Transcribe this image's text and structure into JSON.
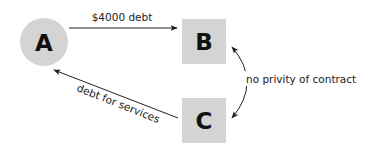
{
  "diagram": {
    "colors": {
      "node_fill": "#d4d4d4",
      "text": "#111111",
      "line": "#222222",
      "background": "#ffffff"
    },
    "nodes": [
      {
        "id": "A",
        "label": "A",
        "shape": "circle"
      },
      {
        "id": "B",
        "label": "B",
        "shape": "square"
      },
      {
        "id": "C",
        "label": "C",
        "shape": "square"
      }
    ],
    "edges": [
      {
        "from": "A",
        "to": "B",
        "label": "$4000 debt",
        "style": "straight"
      },
      {
        "from": "C",
        "to": "A",
        "label": "debt for services",
        "style": "straight"
      },
      {
        "from": "B",
        "to": "C",
        "label": "no privity of contract",
        "style": "curved-bidirectional"
      }
    ]
  }
}
